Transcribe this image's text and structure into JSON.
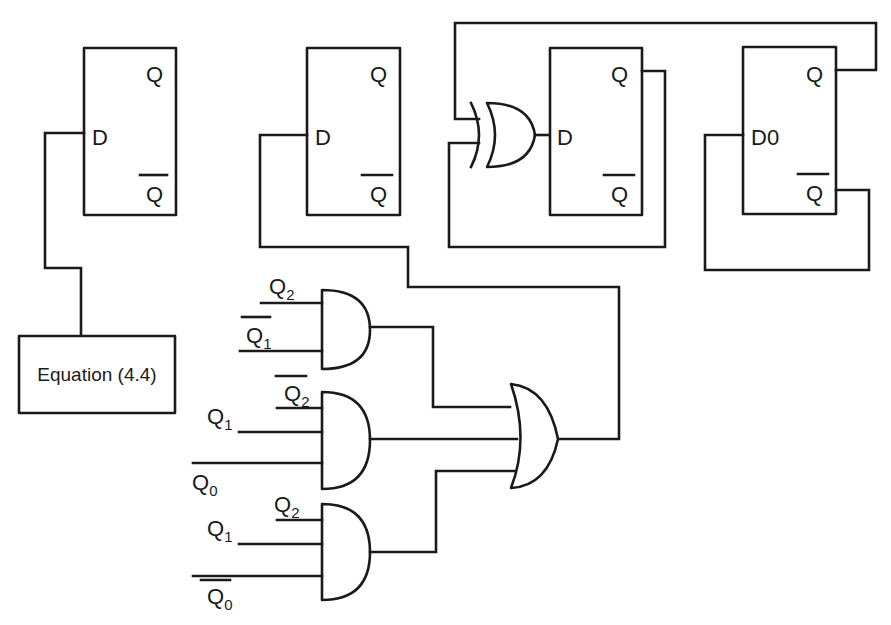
{
  "diagram": {
    "type": "logic-circuit",
    "flip_flops": [
      {
        "id": "ff1",
        "input_label": "D",
        "output_q": "Q",
        "output_qbar": "Q"
      },
      {
        "id": "ff2",
        "input_label": "D",
        "output_q": "Q",
        "output_qbar": "Q"
      },
      {
        "id": "ff3",
        "input_label": "D",
        "output_q": "Q",
        "output_qbar": "Q"
      },
      {
        "id": "ff4",
        "input_label": "D0",
        "output_q": "Q",
        "output_qbar": "Q"
      }
    ],
    "equation_box": {
      "label": "Equation (4.4)"
    },
    "gates": {
      "xor": {
        "type": "XOR",
        "output_to": "ff3.D"
      },
      "and1": {
        "type": "AND",
        "inputs": [
          {
            "name": "Q",
            "sub": "2",
            "negated": false
          },
          {
            "name": "Q",
            "sub": "1",
            "negated": true
          }
        ]
      },
      "and2": {
        "type": "AND",
        "inputs": [
          {
            "name": "Q",
            "sub": "2",
            "negated": true
          },
          {
            "name": "Q",
            "sub": "1",
            "negated": false
          },
          {
            "name": "Q",
            "sub": "0",
            "negated": false
          }
        ]
      },
      "and3": {
        "type": "AND",
        "inputs": [
          {
            "name": "Q",
            "sub": "2",
            "negated": false
          },
          {
            "name": "Q",
            "sub": "1",
            "negated": false
          },
          {
            "name": "Q",
            "sub": "0",
            "negated": true
          }
        ]
      },
      "or": {
        "type": "OR",
        "inputs": 3,
        "output_to": "ff2.D"
      }
    },
    "colors": {
      "line": "#1a1a1a",
      "background": "#ffffff"
    }
  }
}
